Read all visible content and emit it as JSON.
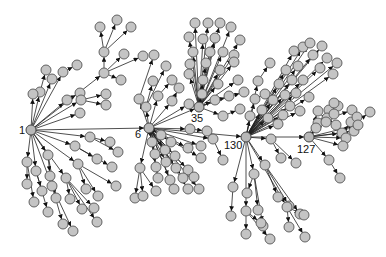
{
  "diagram": {
    "type": "directed-network",
    "node_radius": 5,
    "colors": {
      "node_fill": "#c4c4c4",
      "node_stroke": "#555555",
      "edge": "#222222",
      "background": "#ffffff"
    },
    "hubs": [
      {
        "id": "1",
        "label": "1",
        "x": 31,
        "y": 130,
        "label_dx": -12,
        "label_dy": 4
      },
      {
        "id": "6",
        "label": "6",
        "x": 149,
        "y": 128,
        "label_dx": -14,
        "label_dy": 10
      },
      {
        "id": "35",
        "label": "35",
        "x": 199,
        "y": 107,
        "label_dx": -8,
        "label_dy": 15
      },
      {
        "id": "130",
        "label": "130",
        "x": 246,
        "y": 137,
        "label_dx": -22,
        "label_dy": 12
      },
      {
        "id": "127",
        "label": "127",
        "x": 309,
        "y": 137,
        "label_dx": -12,
        "label_dy": 16
      }
    ],
    "hub_edges": [
      [
        "1",
        "6"
      ],
      [
        "6",
        "130"
      ],
      [
        "130",
        "127"
      ],
      [
        "6",
        "35"
      ]
    ],
    "trees": [
      {
        "root": "1",
        "children": [
          [
            40,
            92,
            [
              [
                46,
                70
              ]
            ]
          ],
          [
            52,
            79,
            []
          ],
          [
            63,
            72,
            [
              [
                77,
                65
              ]
            ]
          ],
          [
            67,
            100,
            [
              [
                80,
                93
              ]
            ]
          ],
          [
            81,
            100,
            [
              [
                106,
                94
              ],
              [
                106,
                105
              ]
            ]
          ],
          [
            80,
            113,
            []
          ],
          [
            104,
            73,
            [
              [
                104,
                52,
                [
                  [
                    100,
                    27
                  ],
                  [
                    117,
                    20
                  ],
                  [
                    131,
                    27
                  ]
                ]
              ],
              [
                124,
                54
              ],
              [
                121,
                80
              ],
              [
                143,
                56
              ]
            ]
          ],
          [
            33,
            94,
            []
          ],
          [
            90,
            137,
            [
              [
                110,
                142
              ],
              [
                118,
                152
              ]
            ]
          ],
          [
            75,
            146,
            [
              [
                97,
                159
              ],
              [
                112,
                167
              ]
            ]
          ],
          [
            78,
            164,
            [
              [
                86,
                189
              ],
              [
                98,
                196
              ],
              [
                116,
                186
              ]
            ]
          ],
          [
            66,
            178,
            [
              [
                70,
                199
              ],
              [
                82,
                209
              ],
              [
                97,
                222
              ],
              [
                94,
                208
              ]
            ]
          ],
          [
            48,
            155,
            [
              [
                50,
                176
              ],
              [
                56,
                198
              ]
            ]
          ],
          [
            27,
            162,
            [
              [
                27,
                184
              ],
              [
                34,
                202
              ]
            ]
          ],
          [
            36,
            171,
            [
              [
                42,
                191
              ],
              [
                48,
                212
              ]
            ]
          ],
          [
            52,
            186,
            [
              [
                63,
                224
              ],
              [
                73,
                231
              ]
            ]
          ]
        ]
      },
      {
        "root": "6",
        "children": [
          [
            146,
            107,
            [
              [
                153,
                81
              ],
              [
                166,
                66
              ]
            ]
          ],
          [
            139,
            99,
            [
              [
                154,
                55
              ]
            ]
          ],
          [
            158,
            96,
            [
              [
                172,
                80
              ]
            ]
          ],
          [
            172,
            101,
            [
              [
                179,
                88
              ]
            ]
          ],
          [
            189,
            104,
            []
          ],
          [
            140,
            168,
            [
              [
                135,
                198
              ],
              [
                143,
                196
              ],
              [
                156,
                191
              ]
            ]
          ],
          [
            190,
            129,
            [
              [
                207,
                131
              ]
            ]
          ],
          [
            213,
            139,
            [
              [
                223,
                160
              ]
            ]
          ],
          [
            152,
            142,
            []
          ],
          [
            161,
            135,
            []
          ],
          [
            171,
            142,
            []
          ],
          [
            155,
            154,
            []
          ],
          [
            165,
            150,
            []
          ],
          [
            175,
            156,
            []
          ],
          [
            188,
            148,
            []
          ],
          [
            156,
            167,
            []
          ],
          [
            166,
            162,
            []
          ],
          [
            176,
            168,
            []
          ],
          [
            188,
            170,
            []
          ],
          [
            158,
            178,
            []
          ],
          [
            170,
            180,
            []
          ],
          [
            183,
            178,
            []
          ],
          [
            194,
            177,
            []
          ],
          [
            174,
            189,
            []
          ],
          [
            188,
            189,
            []
          ],
          [
            199,
            189,
            []
          ],
          [
            201,
            158,
            []
          ],
          [
            201,
            146,
            []
          ]
        ]
      },
      {
        "root": "35",
        "children": [
          [
            195,
            23,
            []
          ],
          [
            208,
            23,
            []
          ],
          [
            220,
            23,
            []
          ],
          [
            231,
            27,
            []
          ],
          [
            189,
            37,
            []
          ],
          [
            203,
            39,
            []
          ],
          [
            215,
            38,
            []
          ],
          [
            240,
            40,
            []
          ],
          [
            193,
            52,
            []
          ],
          [
            210,
            52,
            []
          ],
          [
            223,
            52,
            []
          ],
          [
            234,
            55,
            []
          ],
          [
            190,
            64,
            []
          ],
          [
            206,
            63,
            []
          ],
          [
            220,
            70,
            []
          ],
          [
            234,
            62,
            []
          ],
          [
            189,
            74,
            []
          ],
          [
            203,
            80,
            []
          ],
          [
            218,
            84,
            []
          ],
          [
            238,
            80,
            []
          ],
          [
            202,
            94,
            []
          ],
          [
            215,
            100,
            []
          ],
          [
            229,
            96,
            []
          ],
          [
            244,
            92,
            []
          ],
          [
            223,
            116,
            [
              [
                240,
                109
              ]
            ]
          ]
        ]
      },
      {
        "root": "130",
        "children": [
          [
            255,
            99,
            [
              [
                265,
                94
              ]
            ]
          ],
          [
            250,
            116,
            []
          ],
          [
            258,
            81,
            [
              [
                270,
                63
              ]
            ]
          ],
          [
            262,
            110,
            []
          ],
          [
            268,
            118,
            []
          ],
          [
            273,
            100,
            []
          ],
          [
            278,
            124,
            []
          ],
          [
            283,
            115,
            []
          ],
          [
            285,
            95,
            []
          ],
          [
            290,
            106,
            []
          ],
          [
            279,
            84,
            []
          ],
          [
            292,
            80,
            []
          ],
          [
            296,
            93,
            []
          ],
          [
            300,
            111,
            []
          ],
          [
            286,
            70,
            []
          ],
          [
            298,
            66,
            []
          ],
          [
            303,
            80,
            []
          ],
          [
            309,
            97,
            []
          ],
          [
            294,
            51,
            []
          ],
          [
            303,
            47,
            []
          ],
          [
            313,
            55,
            []
          ],
          [
            320,
            68,
            []
          ],
          [
            310,
            43,
            []
          ],
          [
            322,
            46,
            []
          ],
          [
            327,
            58,
            []
          ],
          [
            333,
            74,
            []
          ],
          [
            337,
            63,
            []
          ],
          [
            271,
            139,
            [
              [
                281,
                158
              ],
              [
                296,
                163
              ]
            ]
          ],
          [
            265,
            165,
            [
              [
                278,
                197
              ],
              [
                289,
                206
              ],
              [
                300,
                214
              ]
            ]
          ],
          [
            254,
            174,
            [
              [
                247,
                193
              ],
              [
                258,
                210
              ],
              [
                263,
                226
              ]
            ]
          ],
          [
            233,
            187,
            [
              [
                231,
                216
              ]
            ]
          ],
          [
            246,
            211,
            [
              [
                246,
                234
              ],
              [
                261,
                223
              ],
              [
                270,
                239
              ]
            ]
          ],
          [
            287,
            207,
            [
              [
                289,
                227
              ],
              [
                304,
                215
              ],
              [
                305,
                237
              ]
            ]
          ]
        ]
      },
      {
        "root": "127",
        "children": [
          [
            318,
            123,
            [
              [
                329,
                110
              ],
              [
                338,
                106
              ],
              [
                352,
                110
              ]
            ]
          ],
          [
            327,
            118,
            [
              [
                336,
                125
              ]
            ]
          ],
          [
            342,
            133,
            [
              [
                351,
                122
              ],
              [
                357,
                117
              ],
              [
                370,
                112
              ]
            ]
          ],
          [
            346,
            138,
            []
          ],
          [
            343,
            146,
            []
          ],
          [
            326,
            122,
            []
          ],
          [
            334,
            114,
            []
          ],
          [
            329,
            160,
            [
              [
                340,
                178
              ]
            ]
          ],
          [
            316,
            128,
            []
          ],
          [
            334,
            103,
            []
          ],
          [
            318,
            111,
            []
          ],
          [
            354,
            131,
            []
          ],
          [
            358,
            125,
            []
          ]
        ]
      }
    ]
  }
}
